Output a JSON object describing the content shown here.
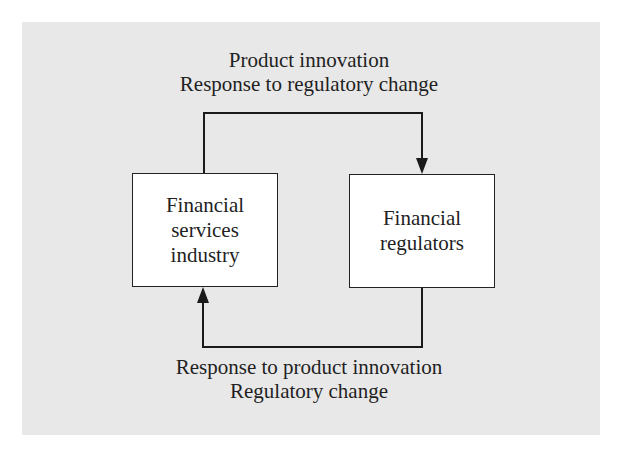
{
  "diagram": {
    "top_label": {
      "line1": "Product innovation",
      "line2": "Response to regulatory change"
    },
    "bottom_label": {
      "line1": "Response to product innovation",
      "line2": "Regulatory change"
    },
    "nodes": [
      {
        "id": "industry",
        "lines": [
          "Financial",
          "services",
          "industry"
        ]
      },
      {
        "id": "regulators",
        "lines": [
          "Financial",
          "regulators"
        ]
      }
    ],
    "edges": [
      {
        "from": "industry",
        "to": "regulators",
        "route": "top",
        "labels": [
          "Product innovation",
          "Response to regulatory change"
        ]
      },
      {
        "from": "regulators",
        "to": "industry",
        "route": "bottom",
        "labels": [
          "Response to product innovation",
          "Regulatory change"
        ]
      }
    ],
    "colors": {
      "panel": "#e8e8e8",
      "box_fill": "#ffffff",
      "line": "#1a1a1a"
    }
  }
}
